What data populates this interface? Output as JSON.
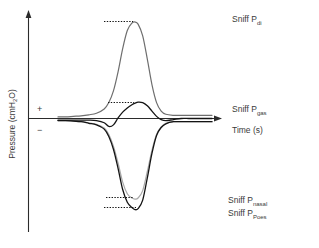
{
  "chart_data": {
    "type": "line",
    "title": "",
    "subtitle": "",
    "xlabel": "Time (s)",
    "ylabel": "Pressure (cmH2O)",
    "ylabel_display": "Pressure (cmH",
    "ylabel_sub": "2",
    "ylabel_tail": "O)",
    "grid": false,
    "legend_position": "right-inline",
    "xlim": [
      0,
      10
    ],
    "ylim": [
      -10,
      10
    ],
    "axis_sign_positive": "+",
    "axis_sign_negative": "−",
    "x": [
      0.0,
      0.5,
      1.0,
      1.5,
      2.0,
      2.5,
      3.0,
      3.3,
      3.6,
      3.9,
      4.2,
      4.5,
      4.8,
      5.0,
      5.2,
      5.5,
      5.8,
      6.1,
      6.4,
      6.7,
      7.0,
      7.5,
      8.0,
      8.5,
      9.0,
      9.5,
      10.0
    ],
    "series": [
      {
        "name": "Sniff Pdi",
        "label_main": "Sniff P",
        "label_sub": "di",
        "color": "#6e6e6e",
        "stroke_width": 1.2,
        "peak_value": 9.1,
        "peak_x": 5.0,
        "marker": "dotted-peak",
        "values": [
          0.15,
          0.15,
          0.2,
          0.25,
          0.35,
          0.5,
          0.9,
          1.5,
          2.6,
          4.4,
          6.6,
          8.3,
          9.0,
          9.1,
          8.9,
          7.8,
          5.6,
          3.2,
          1.5,
          0.7,
          0.4,
          0.3,
          0.3,
          0.3,
          0.3,
          0.3,
          0.3
        ]
      },
      {
        "name": "Sniff Pgas",
        "label_main": "Sniff P",
        "label_sub": "gas",
        "color": "#141414",
        "stroke_width": 1.3,
        "peak_value": 1.55,
        "peak_x": 5.1,
        "marker": "dotted-peak",
        "values": [
          -0.15,
          -0.15,
          -0.15,
          -0.15,
          -0.15,
          -0.2,
          -0.4,
          -0.75,
          -0.6,
          0.05,
          0.6,
          1.0,
          1.3,
          1.45,
          1.55,
          1.5,
          1.2,
          0.7,
          0.2,
          -0.1,
          -0.2,
          -0.1,
          0.0,
          0.0,
          0.0,
          0.0,
          0.0
        ]
      },
      {
        "name": "Sniff Pnasal",
        "label_main": "Sniff P",
        "label_sub": "nasal",
        "color": "#a8a8a8",
        "stroke_width": 1.2,
        "peak_value": -7.6,
        "peak_x": 5.0,
        "marker": "dotted-trough",
        "values": [
          -0.2,
          -0.2,
          -0.25,
          -0.3,
          -0.4,
          -0.55,
          -0.9,
          -1.5,
          -2.6,
          -4.2,
          -6.0,
          -7.1,
          -7.5,
          -7.6,
          -7.5,
          -6.8,
          -5.0,
          -3.0,
          -1.5,
          -0.8,
          -0.45,
          -0.3,
          -0.3,
          -0.3,
          -0.3,
          -0.3,
          -0.3
        ]
      },
      {
        "name": "Sniff PPoes",
        "label_main": "Sniff P",
        "label_sub": "Poes",
        "color": "#141414",
        "stroke_width": 1.3,
        "peak_value": -8.6,
        "peak_x": 5.05,
        "marker": "dotted-trough",
        "values": [
          -0.2,
          -0.2,
          -0.25,
          -0.3,
          -0.45,
          -0.6,
          -1.0,
          -1.7,
          -2.9,
          -4.7,
          -6.7,
          -7.9,
          -8.4,
          -8.6,
          -8.5,
          -7.7,
          -5.6,
          -3.3,
          -1.6,
          -0.85,
          -0.5,
          -0.3,
          -0.3,
          -0.3,
          -0.3,
          -0.3,
          -0.3
        ]
      }
    ],
    "annotations": [
      {
        "text": "Sniff Pdi",
        "x": 11.2,
        "y": 9.6
      },
      {
        "text": "Sniff Pgas",
        "x": 11.2,
        "y": 1.1
      },
      {
        "text": "Sniff Pnasal",
        "x": 11.2,
        "y": -7.9
      },
      {
        "text": "Sniff PPoes",
        "x": 11.2,
        "y": -9.2
      }
    ]
  },
  "axes": {
    "x_title": "Time (s)",
    "y_title_main": "Pressure (cmH",
    "y_title_sub": "2",
    "y_title_tail": "O)",
    "plus_sign": "+",
    "minus_sign": "−"
  },
  "labels": {
    "pdi_main": "Sniff P",
    "pdi_sub": "di",
    "pgas_main": "Sniff P",
    "pgas_sub": "gas",
    "pnasal_main": "Sniff P",
    "pnasal_sub": "nasal",
    "ppoes_main": "Sniff P",
    "ppoes_sub": "Poes"
  },
  "colors": {
    "pdi": "#6e6e6e",
    "pgas": "#141414",
    "pnasal": "#a8a8a8",
    "ppoes": "#141414",
    "axis": "#2b2b2b",
    "text": "#3a3a3a",
    "background": "#ffffff"
  }
}
